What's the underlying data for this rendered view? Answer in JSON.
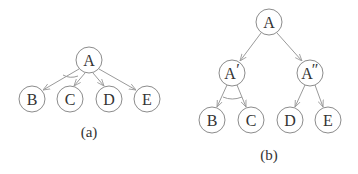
{
  "diagrams": [
    {
      "caption": "(a)",
      "nodes": [
        {
          "id": "A",
          "label": "A",
          "x": 89,
          "y": 60
        },
        {
          "id": "B",
          "label": "B",
          "x": 32,
          "y": 99
        },
        {
          "id": "C",
          "label": "C",
          "x": 70,
          "y": 99
        },
        {
          "id": "D",
          "label": "D",
          "x": 109,
          "y": 99
        },
        {
          "id": "E",
          "label": "E",
          "x": 147,
          "y": 99
        }
      ],
      "edges": [
        [
          "A",
          "B"
        ],
        [
          "A",
          "C"
        ],
        [
          "A",
          "D"
        ],
        [
          "A",
          "E"
        ]
      ],
      "and_arc": [
        "A",
        "B",
        "C"
      ]
    },
    {
      "caption": "(b)",
      "nodes": [
        {
          "id": "A",
          "label": "A",
          "x": 269,
          "y": 22
        },
        {
          "id": "A1",
          "label": "A",
          "prime": "′",
          "x": 232,
          "y": 73
        },
        {
          "id": "A2",
          "label": "A",
          "prime": "″",
          "x": 310,
          "y": 73
        },
        {
          "id": "B",
          "label": "B",
          "x": 212,
          "y": 120
        },
        {
          "id": "C",
          "label": "C",
          "x": 251,
          "y": 120
        },
        {
          "id": "D",
          "label": "D",
          "x": 290,
          "y": 120
        },
        {
          "id": "E",
          "label": "E",
          "x": 328,
          "y": 120
        }
      ],
      "edges": [
        [
          "A",
          "A1"
        ],
        [
          "A",
          "A2"
        ],
        [
          "A1",
          "B"
        ],
        [
          "A1",
          "C"
        ],
        [
          "A2",
          "D"
        ],
        [
          "A2",
          "E"
        ]
      ],
      "and_arc": [
        "A1",
        "B",
        "C"
      ]
    }
  ],
  "captions": {
    "a": "(a)",
    "b": "(b)"
  },
  "labels": {
    "a_A": "A",
    "a_B": "B",
    "a_C": "C",
    "a_D": "D",
    "a_E": "E",
    "b_A": "A",
    "b_A1": "A",
    "b_A1_prime": "′",
    "b_A2": "A",
    "b_A2_prime": "″",
    "b_B": "B",
    "b_C": "C",
    "b_D": "D",
    "b_E": "E"
  }
}
